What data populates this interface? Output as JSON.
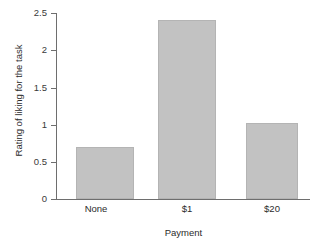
{
  "chart_data": {
    "type": "bar",
    "title": "",
    "subtitle": "",
    "xlabel": "Payment",
    "ylabel": "Rating of liking for the task",
    "categories": [
      "None",
      "$1",
      "$20"
    ],
    "values": [
      0.7,
      2.4,
      1.02
    ],
    "series": [
      {
        "name": "Rating of liking for the task",
        "values": [
          0.7,
          2.4,
          1.02
        ]
      }
    ],
    "ylim": [
      0,
      2.5
    ],
    "ytick_labels": [
      "0",
      "0.5",
      "1",
      "1.5",
      "2",
      "2.5"
    ],
    "ytick_values": [
      0,
      0.5,
      1,
      1.5,
      2,
      2.5
    ],
    "grid": false,
    "legend": false,
    "legend_position": "none",
    "bar_color": "#c2c2c2",
    "bar_border_color": "#b4b4b4",
    "axis_color": "#6e6e6e",
    "background_color": "#ffffff"
  },
  "axes": {
    "y_title": "Rating of liking for the task",
    "x_title": "Payment",
    "y_ticks": [
      {
        "label": "2.5",
        "value": 2.5
      },
      {
        "label": "2",
        "value": 2
      },
      {
        "label": "1.5",
        "value": 1.5
      },
      {
        "label": "1",
        "value": 1
      },
      {
        "label": "0.5",
        "value": 0.5
      },
      {
        "label": "0",
        "value": 0
      }
    ],
    "x_categories": [
      {
        "label": "None"
      },
      {
        "label": "$1"
      },
      {
        "label": "$20"
      }
    ]
  },
  "bars": [
    {
      "label": "None",
      "value": 0.7
    },
    {
      "label": "$1",
      "value": 2.4
    },
    {
      "label": "$20",
      "value": 1.02
    }
  ]
}
